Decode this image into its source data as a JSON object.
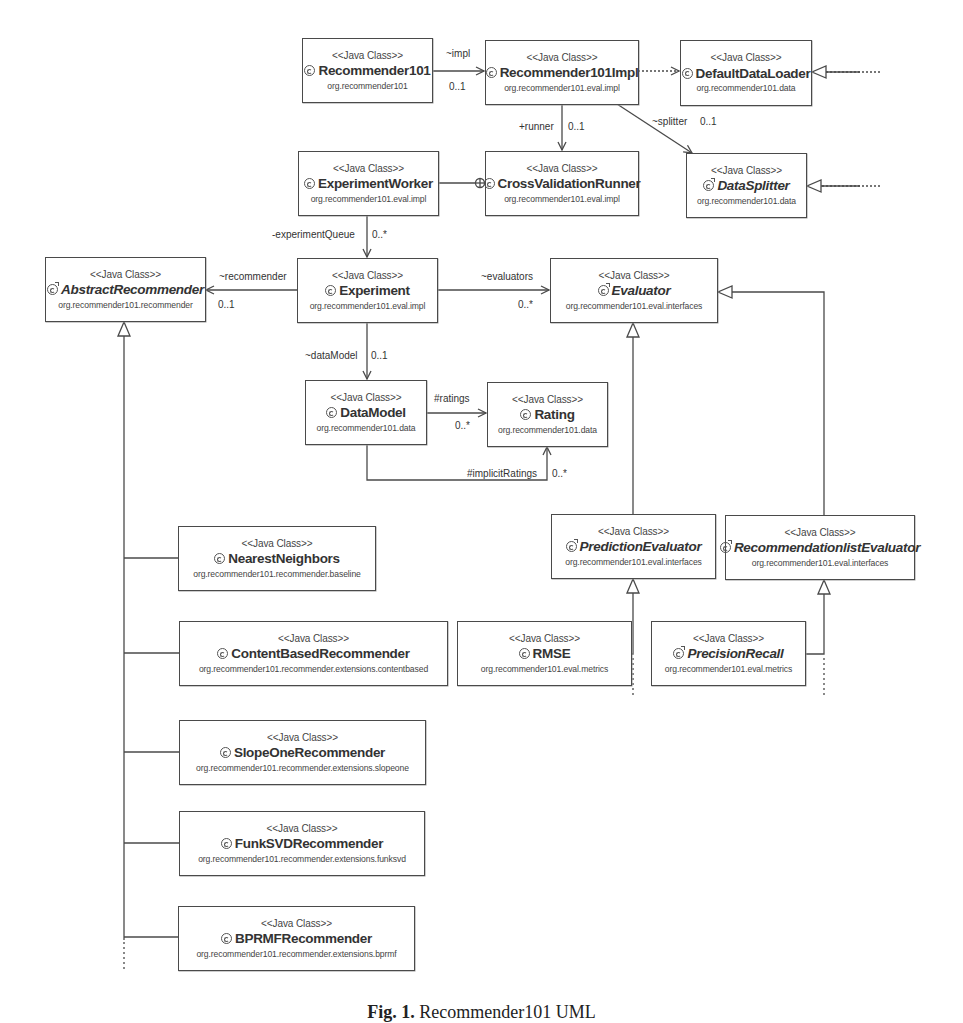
{
  "stereotype": "<<Java Class>>",
  "classes": {
    "recommender101": {
      "name": "Recommender101",
      "package": "org.recommender101",
      "abstract": false
    },
    "recommender101impl": {
      "name": "Recommender101Impl",
      "package": "org.recommender101.eval.impl",
      "abstract": false
    },
    "defaultDataLoader": {
      "name": "DefaultDataLoader",
      "package": "org.recommender101.data",
      "abstract": false
    },
    "experimentWorker": {
      "name": "ExperimentWorker",
      "package": "org.recommender101.eval.impl",
      "abstract": false
    },
    "crossValidationRunner": {
      "name": "CrossValidationRunner",
      "package": "org.recommender101.eval.impl",
      "abstract": false
    },
    "dataSplitter": {
      "name": "DataSplitter",
      "package": "org.recommender101.data",
      "abstract": true
    },
    "abstractRecommender": {
      "name": "AbstractRecommender",
      "package": "org.recommender101.recommender",
      "abstract": true
    },
    "experiment": {
      "name": "Experiment",
      "package": "org.recommender101.eval.impl",
      "abstract": false
    },
    "evaluator": {
      "name": "Evaluator",
      "package": "org.recommender101.eval.interfaces",
      "abstract": true
    },
    "dataModel": {
      "name": "DataModel",
      "package": "org.recommender101.data",
      "abstract": false
    },
    "rating": {
      "name": "Rating",
      "package": "org.recommender101.data",
      "abstract": false
    },
    "predictionEvaluator": {
      "name": "PredictionEvaluator",
      "package": "org.recommender101.eval.interfaces",
      "abstract": true
    },
    "recommendationlistEvaluator": {
      "name": "RecommendationlistEvaluator",
      "package": "org.recommender101.eval.interfaces",
      "abstract": true
    },
    "rmse": {
      "name": "RMSE",
      "package": "org.recommender101.eval.metrics",
      "abstract": false
    },
    "precisionRecall": {
      "name": "PrecisionRecall",
      "package": "org.recommender101.eval.metrics",
      "abstract": true
    },
    "nearestNeighbors": {
      "name": "NearestNeighbors",
      "package": "org.recommender101.recommender.baseline",
      "abstract": false
    },
    "contentBasedRecommender": {
      "name": "ContentBasedRecommender",
      "package": "org.recommender101.recommender.extensions.contentbased",
      "abstract": false
    },
    "slopeOneRecommender": {
      "name": "SlopeOneRecommender",
      "package": "org.recommender101.recommender.extensions.slopeone",
      "abstract": false
    },
    "funkSVDRecommender": {
      "name": "FunkSVDRecommender",
      "package": "org.recommender101.recommender.extensions.funksvd",
      "abstract": false
    },
    "bprmfRecommender": {
      "name": "BPRMFRecommender",
      "package": "org.recommender101.recommender.extensions.bprmf",
      "abstract": false
    }
  },
  "associations": {
    "impl": {
      "role": "~impl",
      "multiplicity": "0..1"
    },
    "runner": {
      "role": "+runner",
      "multiplicity": "0..1"
    },
    "splitter": {
      "role": "~splitter",
      "multiplicity": "0..1"
    },
    "experimentQueue": {
      "role": "-experimentQueue",
      "multiplicity": "0..*"
    },
    "recommender": {
      "role": "~recommender",
      "multiplicity": "0..1"
    },
    "evaluators": {
      "role": "~evaluators",
      "multiplicity": "0..*"
    },
    "dataModel": {
      "role": "~dataModel",
      "multiplicity": "0..1"
    },
    "ratings": {
      "role": "#ratings",
      "multiplicity": "0..*"
    },
    "implicitRatings": {
      "role": "#implicitRatings",
      "multiplicity": "0..*"
    }
  },
  "caption": {
    "label": "Fig. 1.",
    "text": "Recommender101 UML"
  },
  "colors": {
    "line": "#4a4a4a",
    "box_border": "#4a4a4a",
    "background": "#ffffff"
  }
}
